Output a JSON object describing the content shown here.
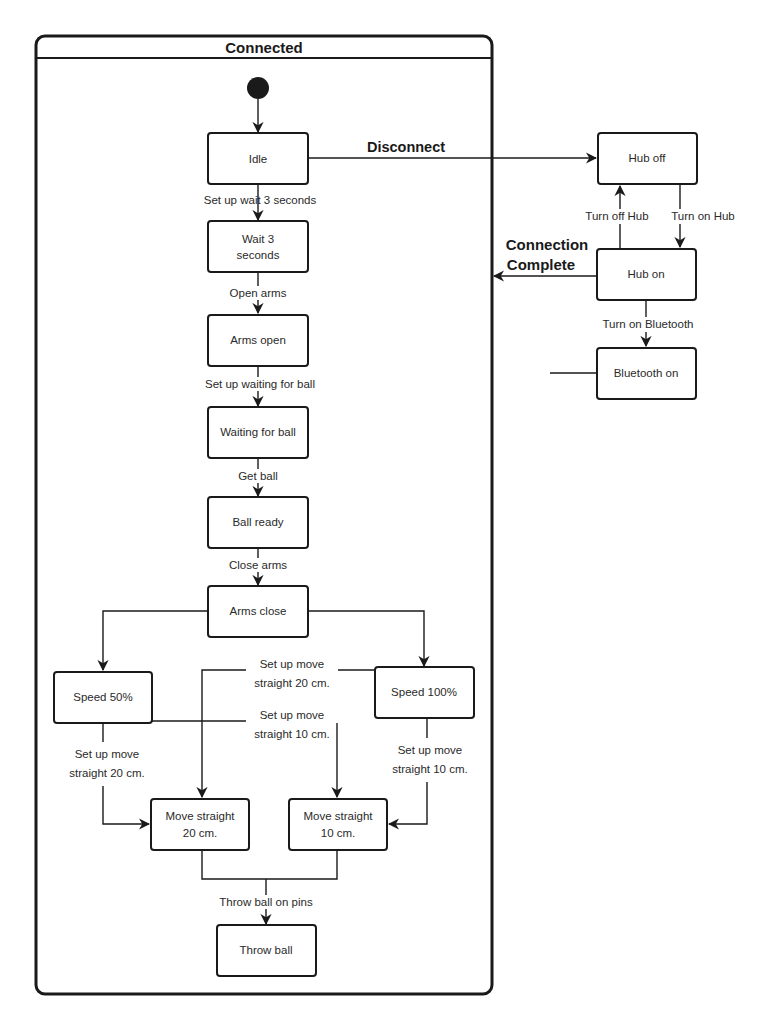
{
  "diagram": {
    "type": "uml-state-machine",
    "composite_state": {
      "title": "Connected"
    },
    "states": {
      "idle": "Idle",
      "wait3_l1": "Wait 3",
      "wait3_l2": "seconds",
      "arms_open": "Arms open",
      "waiting_ball": "Waiting for ball",
      "ball_ready": "Ball ready",
      "arms_close": "Arms close",
      "speed50": "Speed 50%",
      "speed100": "Speed 100%",
      "move20_l1": "Move straight",
      "move20_l2": "20 cm.",
      "move10_l1": "Move straight",
      "move10_l2": "10 cm.",
      "throw_ball": "Throw ball",
      "hub_off": "Hub off",
      "hub_on": "Hub on",
      "bluetooth_on": "Bluetooth on"
    },
    "transitions": {
      "disconnect": "Disconnect",
      "connection_complete_l1": "Connection",
      "connection_complete_l2": "Complete",
      "setup_wait": "Set up wait 3 seconds",
      "open_arms": "Open arms",
      "setup_waiting": "Set up waiting for ball",
      "get_ball": "Get ball",
      "close_arms": "Close arms",
      "s50_to_20_l1": "Set up move",
      "s50_to_20_l2": "straight 20 cm.",
      "s100_to_20_l1": "Set up move",
      "s100_to_20_l2": "straight 20 cm.",
      "s50_to_10_l1": "Set up move",
      "s50_to_10_l2": "straight 10 cm.",
      "s100_to_10_l1": "Set up move",
      "s100_to_10_l2": "straight 10 cm.",
      "throw_on_pins": "Throw ball on pins",
      "turn_off_hub": "Turn off Hub",
      "turn_on_hub": "Turn on Hub",
      "turn_on_bluetooth": "Turn on Bluetooth"
    }
  }
}
